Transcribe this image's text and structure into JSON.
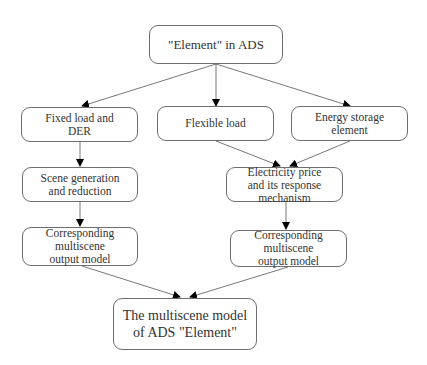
{
  "diagram": {
    "type": "flowchart",
    "colors": {
      "border": "#6e6e6e",
      "text": "#333333",
      "arrow": "#000000",
      "background": "#ffffff"
    },
    "nodes": {
      "root": {
        "lines": [
          "\"Element\" in ADS"
        ]
      },
      "fixed_load": {
        "lines": [
          "Fixed load and",
          "DER"
        ]
      },
      "flexible_load": {
        "lines": [
          "Flexible load"
        ]
      },
      "energy_storage": {
        "lines": [
          "Energy storage",
          "element"
        ]
      },
      "scene_generation": {
        "lines": [
          "Scene generation",
          "and reduction"
        ]
      },
      "electricity_price": {
        "lines": [
          "Electricity price",
          "and its response",
          "mechanism"
        ]
      },
      "output_left": {
        "lines": [
          "Corresponding",
          "multiscene",
          "output model"
        ]
      },
      "output_right": {
        "lines": [
          "Corresponding",
          "multiscene",
          "output model"
        ]
      },
      "final": {
        "lines": [
          "The multiscene model",
          "of ADS \"Element\""
        ]
      }
    },
    "edges": [
      {
        "from": "root",
        "to": "fixed_load"
      },
      {
        "from": "root",
        "to": "flexible_load"
      },
      {
        "from": "root",
        "to": "energy_storage"
      },
      {
        "from": "fixed_load",
        "to": "scene_generation"
      },
      {
        "from": "flexible_load",
        "to": "electricity_price"
      },
      {
        "from": "energy_storage",
        "to": "electricity_price"
      },
      {
        "from": "scene_generation",
        "to": "output_left"
      },
      {
        "from": "electricity_price",
        "to": "output_right"
      },
      {
        "from": "output_left",
        "to": "final"
      },
      {
        "from": "output_right",
        "to": "final"
      }
    ]
  }
}
